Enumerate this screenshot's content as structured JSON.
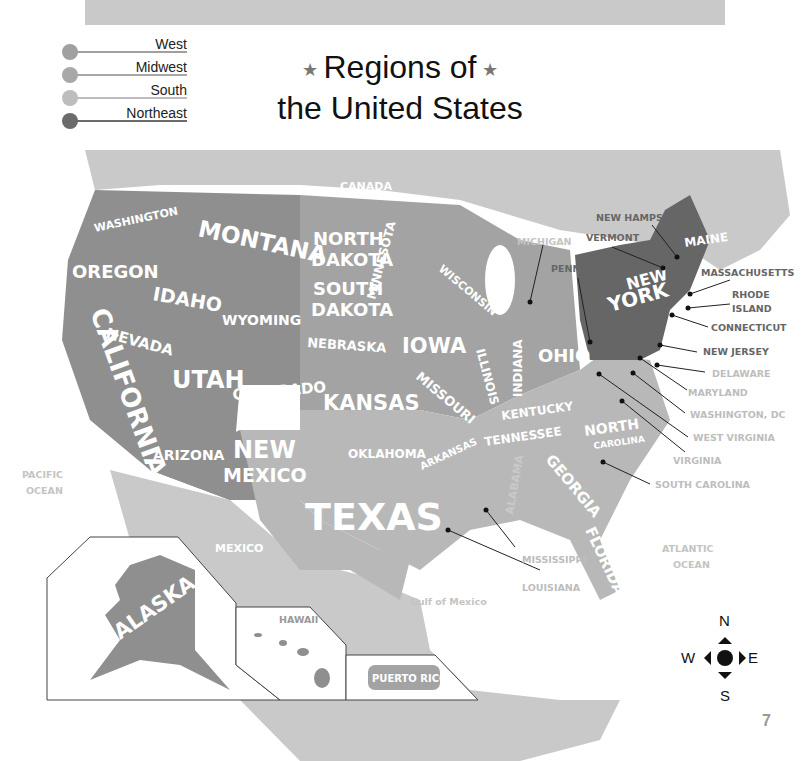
{
  "title": {
    "line1": "Regions of",
    "line2": "the United States",
    "star": "★"
  },
  "legend": [
    {
      "label": "West",
      "color": "#9a9a9a"
    },
    {
      "label": "Midwest",
      "color": "#a8a8a8"
    },
    {
      "label": "South",
      "color": "#bdbdbd"
    },
    {
      "label": "Northeast",
      "color": "#6b6b6b"
    }
  ],
  "region_colors": {
    "west": "#8f8f8f",
    "midwest": "#a3a3a3",
    "south": "#b8b8b8",
    "northeast": "#666666",
    "foreign": "#c9c9c9",
    "water_label": "#c4c4c4"
  },
  "map": {
    "countries": {
      "canada": "CANADA",
      "mexico": "MEXICO"
    },
    "water": {
      "pacific1": "PACIFIC",
      "pacific2": "OCEAN",
      "atlantic1": "ATLANTIC",
      "atlantic2": "OCEAN",
      "gulf": "Gulf of Mexico"
    },
    "states": {
      "washington": "WASHINGTON",
      "oregon": "OREGON",
      "california": "CALIFORNIA",
      "nevada": "NEVADA",
      "idaho": "IDAHO",
      "montana": "MONTANA",
      "wyoming": "WYOMING",
      "utah": "UTAH",
      "colorado": "COLORADO",
      "arizona": "ARIZONA",
      "new_mexico1": "NEW",
      "new_mexico2": "MEXICO",
      "north_dakota1": "NORTH",
      "north_dakota2": "DAKOTA",
      "south_dakota1": "SOUTH",
      "south_dakota2": "DAKOTA",
      "nebraska": "NEBRASKA",
      "kansas": "KANSAS",
      "minnesota": "MINNESOTA",
      "iowa": "IOWA",
      "missouri": "MISSOURI",
      "wisconsin": "WISCONSIN",
      "illinois": "ILLINOIS",
      "indiana": "INDIANA",
      "ohio": "OHIO",
      "oklahoma": "OKLAHOMA",
      "texas": "TEXAS",
      "arkansas": "ARKANSAS",
      "kentucky": "KENTUCKY",
      "tennessee": "TENNESSEE",
      "alabama": "ALABAMA",
      "georgia": "GEORGIA",
      "florida": "FLORIDA",
      "north_carolina1": "NORTH",
      "north_carolina2": "CAROLINA",
      "new_york1": "NEW",
      "new_york2": "YORK",
      "maine": "MAINE",
      "alaska": "ALASKA",
      "hawaii": "HAWAII",
      "puerto_rico": "PUERTO RICO"
    },
    "callouts": {
      "michigan": "MICHIGAN",
      "pennsylvania": "PENNSYLVANIA",
      "vermont": "VERMONT",
      "new_hampshire": "NEW HAMPSHIRE",
      "massachusetts": "MASSACHUSETTS",
      "rhode_island1": "RHODE",
      "rhode_island2": "ISLAND",
      "connecticut": "CONNECTICUT",
      "new_jersey": "NEW JERSEY",
      "delaware": "DELAWARE",
      "maryland": "MARYLAND",
      "washington_dc": "WASHINGTON, DC",
      "west_virginia": "WEST VIRGINIA",
      "virginia": "VIRGINIA",
      "south_carolina": "SOUTH CAROLINA",
      "mississippi": "MISSISSIPPI",
      "louisiana": "LOUISIANA"
    }
  },
  "compass": {
    "n": "N",
    "s": "S",
    "e": "E",
    "w": "W"
  },
  "page_number": "7"
}
